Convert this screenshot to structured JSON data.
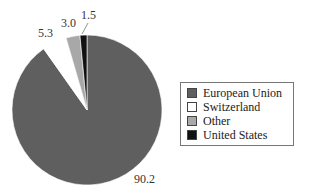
{
  "chart_data": {
    "type": "pie",
    "title": "",
    "categories": [
      "European Union",
      "Switzerland",
      "Other",
      "United States"
    ],
    "values": [
      90.2,
      5.3,
      3.0,
      1.5
    ],
    "colors": [
      "#5f5f5f",
      "#ffffff",
      "#a8a8a8",
      "#111111"
    ],
    "value_labels": [
      "90.2",
      "5.3",
      "3.0",
      "1.5"
    ],
    "legend_position": "right"
  },
  "legend": {
    "items": [
      {
        "label": "European Union",
        "color": "#5f5f5f"
      },
      {
        "label": "Switzerland",
        "color": "#ffffff"
      },
      {
        "label": "Other",
        "color": "#a8a8a8"
      },
      {
        "label": "United States",
        "color": "#111111"
      }
    ]
  }
}
